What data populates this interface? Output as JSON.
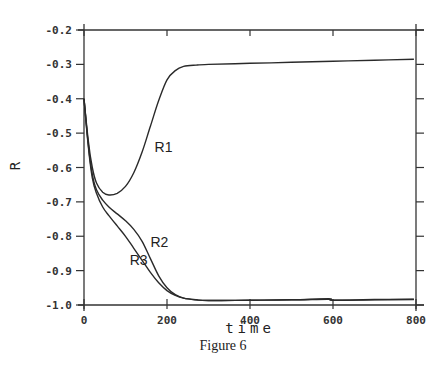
{
  "figure": {
    "caption": "Figure 6"
  },
  "chart_data": {
    "type": "line",
    "title": "",
    "xlabel": "time",
    "ylabel": "R",
    "xlim": [
      0,
      800
    ],
    "ylim": [
      -1.0,
      -0.2
    ],
    "xticks": [
      0,
      200,
      400,
      600,
      800
    ],
    "xtick_labels": [
      "0",
      "200",
      "400",
      "600",
      "800"
    ],
    "yticks": [
      -0.2,
      -0.3,
      -0.4,
      -0.5,
      -0.6,
      -0.7,
      -0.8,
      -0.9,
      -1.0
    ],
    "ytick_labels": [
      "-0.2",
      "-0.3",
      "-0.4",
      "-0.5",
      "-0.6",
      "-0.7",
      "-0.8",
      "-0.9",
      "-1.0"
    ],
    "grid": false,
    "legend": "inline labels",
    "series": [
      {
        "name": "R1",
        "label_pos": {
          "t": 170,
          "R": -0.555
        },
        "x": [
          0,
          10,
          20,
          30,
          45,
          60,
          80,
          100,
          120,
          140,
          160,
          180,
          200,
          220,
          240,
          270,
          300,
          400,
          500,
          600,
          700,
          795
        ],
        "values": [
          -0.4,
          -0.52,
          -0.6,
          -0.645,
          -0.672,
          -0.68,
          -0.675,
          -0.655,
          -0.615,
          -0.555,
          -0.48,
          -0.405,
          -0.345,
          -0.318,
          -0.306,
          -0.302,
          -0.3,
          -0.297,
          -0.294,
          -0.291,
          -0.288,
          -0.285
        ]
      },
      {
        "name": "R2",
        "label_pos": {
          "t": 160,
          "R": -0.832
        },
        "x": [
          0,
          10,
          20,
          30,
          45,
          60,
          80,
          100,
          120,
          140,
          160,
          180,
          200,
          220,
          240,
          270,
          300,
          400,
          500,
          590,
          600,
          700,
          795
        ],
        "values": [
          -0.4,
          -0.53,
          -0.62,
          -0.665,
          -0.695,
          -0.715,
          -0.735,
          -0.755,
          -0.78,
          -0.815,
          -0.865,
          -0.915,
          -0.95,
          -0.97,
          -0.98,
          -0.985,
          -0.987,
          -0.986,
          -0.985,
          -0.982,
          -0.986,
          -0.984,
          -0.983
        ]
      },
      {
        "name": "R3",
        "label_pos": {
          "t": 110,
          "R": -0.885
        },
        "x": [
          0,
          10,
          20,
          30,
          45,
          60,
          80,
          100,
          120,
          140,
          160,
          180,
          200,
          220,
          240,
          270,
          300,
          400,
          500,
          590,
          600,
          700,
          795
        ],
        "values": [
          -0.4,
          -0.535,
          -0.63,
          -0.675,
          -0.715,
          -0.74,
          -0.77,
          -0.8,
          -0.835,
          -0.87,
          -0.905,
          -0.935,
          -0.958,
          -0.972,
          -0.98,
          -0.985,
          -0.987,
          -0.986,
          -0.985,
          -0.983,
          -0.986,
          -0.985,
          -0.984
        ]
      }
    ]
  },
  "colors": {
    "line": "#2a2a2a",
    "axis": "#333333",
    "background": "#ffffff"
  }
}
